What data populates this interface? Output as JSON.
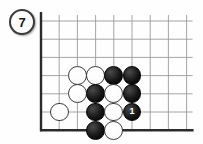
{
  "diagram": {
    "type": "go-board-problem",
    "label": {
      "text": "7",
      "shape": "circle",
      "position": "top-left"
    },
    "board": {
      "edges": [
        "left",
        "bottom"
      ],
      "columns": 9,
      "rows": 7,
      "cell_size": 18.2,
      "origin_x": 41,
      "origin_y": 21,
      "grid_color": "#9a9a9a",
      "edge_color": "#2b2b2b",
      "background": "#fefefe"
    },
    "colors": {
      "black_stone": "#111111",
      "white_stone": "#fdfdfd",
      "stone_outline": "#3d3d3d",
      "move_number_text": "#ffffff"
    },
    "stones": [
      {
        "color": "white",
        "col": 2,
        "row": 3,
        "number": null
      },
      {
        "color": "white",
        "col": 3,
        "row": 3,
        "number": null
      },
      {
        "color": "black",
        "col": 4,
        "row": 3,
        "number": null
      },
      {
        "color": "black",
        "col": 5,
        "row": 3,
        "number": null
      },
      {
        "color": "white",
        "col": 2,
        "row": 4,
        "number": null
      },
      {
        "color": "black",
        "col": 3,
        "row": 4,
        "number": null
      },
      {
        "color": "white",
        "col": 4,
        "row": 4,
        "number": null
      },
      {
        "color": "black",
        "col": 5,
        "row": 4,
        "number": null
      },
      {
        "color": "white",
        "col": 1,
        "row": 5,
        "number": null
      },
      {
        "color": "black",
        "col": 3,
        "row": 5,
        "number": null
      },
      {
        "color": "white",
        "col": 4,
        "row": 5,
        "number": null
      },
      {
        "color": "black",
        "col": 5,
        "row": 5,
        "number": "1"
      },
      {
        "color": "black",
        "col": 3,
        "row": 6,
        "number": null
      },
      {
        "color": "white",
        "col": 4,
        "row": 6,
        "number": null
      }
    ]
  }
}
